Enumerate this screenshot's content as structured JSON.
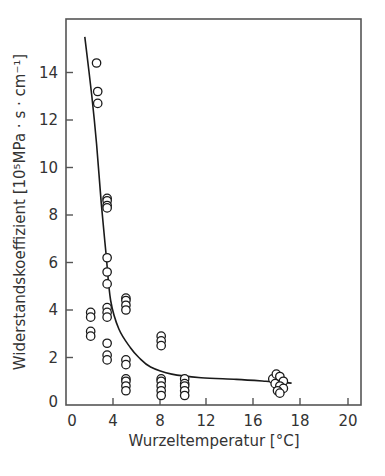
{
  "chart_data": {
    "type": "scatter",
    "title": "",
    "xlabel": "Wurzeltemperatur [°C]",
    "ylabel": "Widerstandskoeffizient [10⁵MPa · s · cm⁻¹]",
    "x_tick_labels": [
      "0",
      "4",
      "8",
      "12",
      "16",
      "18",
      "20"
    ],
    "y_tick_labels": [
      "0",
      "2",
      "4",
      "6",
      "8",
      "10",
      "12",
      "14"
    ],
    "xlim": [
      0,
      20
    ],
    "ylim": [
      0,
      16
    ],
    "grid": false,
    "legend": null,
    "series": [
      {
        "name": "Messwerte",
        "marker": "open-circle",
        "points": [
          [
            2.6,
            14.4
          ],
          [
            2.7,
            13.2
          ],
          [
            2.7,
            12.7
          ],
          [
            2.1,
            3.9
          ],
          [
            2.1,
            3.7
          ],
          [
            2.1,
            3.1
          ],
          [
            2.1,
            2.9
          ],
          [
            3.5,
            8.7
          ],
          [
            3.5,
            8.6
          ],
          [
            3.5,
            8.4
          ],
          [
            3.5,
            8.3
          ],
          [
            3.5,
            6.2
          ],
          [
            3.5,
            5.6
          ],
          [
            3.5,
            5.1
          ],
          [
            3.5,
            4.1
          ],
          [
            3.5,
            3.9
          ],
          [
            3.5,
            3.7
          ],
          [
            3.5,
            2.6
          ],
          [
            3.5,
            2.1
          ],
          [
            3.5,
            1.9
          ],
          [
            5.1,
            4.5
          ],
          [
            5.1,
            4.4
          ],
          [
            5.1,
            4.2
          ],
          [
            5.1,
            4.0
          ],
          [
            5.1,
            1.9
          ],
          [
            5.1,
            1.7
          ],
          [
            5.1,
            1.1
          ],
          [
            5.1,
            1.0
          ],
          [
            5.1,
            0.8
          ],
          [
            5.1,
            0.6
          ],
          [
            8.1,
            2.9
          ],
          [
            8.1,
            2.7
          ],
          [
            8.1,
            2.5
          ],
          [
            8.1,
            1.1
          ],
          [
            8.1,
            1.0
          ],
          [
            8.1,
            0.8
          ],
          [
            8.1,
            0.6
          ],
          [
            8.1,
            0.4
          ],
          [
            10.1,
            1.1
          ],
          [
            10.1,
            0.9
          ],
          [
            10.1,
            0.8
          ],
          [
            10.1,
            0.6
          ],
          [
            10.1,
            0.4
          ],
          [
            17.6,
            1.1
          ],
          [
            17.9,
            1.3
          ],
          [
            18.2,
            1.2
          ],
          [
            18.5,
            1.0
          ],
          [
            17.8,
            0.9
          ],
          [
            18.2,
            0.8
          ],
          [
            18.5,
            0.7
          ],
          [
            18.0,
            0.6
          ],
          [
            18.2,
            0.5
          ]
        ]
      },
      {
        "name": "Ausgleichskurve",
        "marker": "line",
        "points": [
          [
            1.6,
            15.5
          ],
          [
            2.2,
            13.0
          ],
          [
            2.6,
            11.0
          ],
          [
            3.0,
            8.5
          ],
          [
            3.4,
            6.4
          ],
          [
            3.8,
            4.4
          ],
          [
            4.5,
            3.2
          ],
          [
            5.5,
            2.4
          ],
          [
            6.2,
            2.0
          ],
          [
            7.2,
            1.6
          ],
          [
            9.0,
            1.3
          ],
          [
            11.5,
            1.15
          ],
          [
            14.5,
            1.08
          ],
          [
            17.0,
            1.0
          ],
          [
            19.2,
            0.92
          ]
        ]
      }
    ]
  },
  "layout": {
    "plot_left_px": 66,
    "plot_right_px": 361,
    "plot_top_px": 19,
    "plot_bottom_px": 405,
    "x_tick_px": [
      66,
      113,
      160,
      206,
      253,
      300,
      348
    ],
    "px_per_x_unit": 11.75,
    "px_per_y_unit": 23.75,
    "line_color": "#1a1a1a",
    "frame_color": "#555555"
  }
}
